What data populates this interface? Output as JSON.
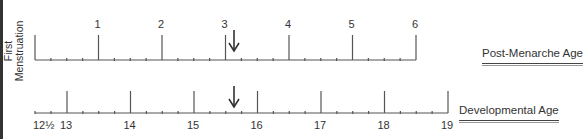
{
  "diagram": {
    "left_label_line1": "First",
    "left_label_line2": "Menstruation",
    "top_axis": {
      "title": "Post-Menarche Age",
      "major_labels": [
        "1",
        "2",
        "3",
        "4",
        "5",
        "6"
      ],
      "minor_ticks_per_interval": 3,
      "marker": "arrow-down",
      "marker_position": 3.15
    },
    "bottom_axis": {
      "title": "Developmental Age",
      "start_label": "12½",
      "major_labels": [
        "13",
        "14",
        "15",
        "16",
        "17",
        "18",
        "19"
      ],
      "minor_ticks_per_interval": 3,
      "marker": "arrow-down",
      "marker_position": 15.65
    },
    "colors": {
      "line": "#444444",
      "text": "#333333"
    }
  }
}
